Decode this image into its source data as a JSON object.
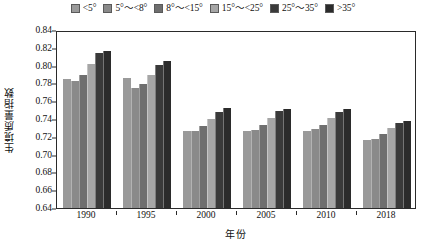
{
  "chart_data": {
    "type": "bar",
    "title": "",
    "xlabel": "年份",
    "ylabel": "生境质量指数",
    "ylim": [
      0.64,
      0.84
    ],
    "ytick_step": 0.02,
    "yticks": [
      "0.84",
      "0.82",
      "0.80",
      "0.78",
      "0.76",
      "0.74",
      "0.72",
      "0.70",
      "0.68",
      "0.66",
      "0.64"
    ],
    "grid": false,
    "legend_position": "top-center",
    "categories": [
      "1990",
      "1995",
      "2000",
      "2005",
      "2010",
      "2018"
    ],
    "series": [
      {
        "name": "<5°",
        "color": "#9a9a9a",
        "values": [
          0.785,
          0.786,
          0.726,
          0.727,
          0.727,
          0.716
        ]
      },
      {
        "name": "5°～<8°",
        "color": "#8a8a8a",
        "values": [
          0.783,
          0.775,
          0.727,
          0.728,
          0.729,
          0.718
        ]
      },
      {
        "name": "8°～<15°",
        "color": "#6e6e6e",
        "values": [
          0.79,
          0.779,
          0.732,
          0.733,
          0.733,
          0.723
        ]
      },
      {
        "name": "15°～<25°",
        "color": "#a6a6a6",
        "values": [
          0.802,
          0.79,
          0.74,
          0.741,
          0.741,
          0.73
        ]
      },
      {
        "name": "25°～35°",
        "color": "#3a3a3a",
        "values": [
          0.814,
          0.801,
          0.748,
          0.749,
          0.748,
          0.736
        ]
      },
      {
        "name": ">35°",
        "color": "#2b2b2b",
        "values": [
          0.816,
          0.805,
          0.752,
          0.751,
          0.751,
          0.738
        ]
      }
    ]
  }
}
